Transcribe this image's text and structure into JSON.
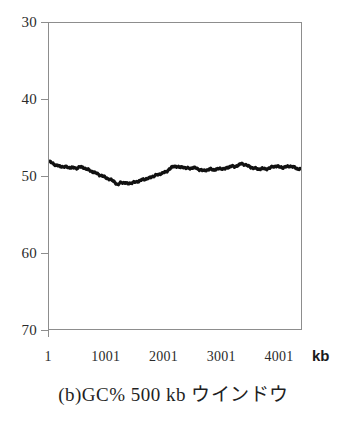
{
  "caption": "(b)GC% 500 kb ウインドウ",
  "axis": {
    "x_unit": "kb",
    "y_ticks": [
      "70",
      "60",
      "50",
      "40",
      "30"
    ],
    "x_ticks": [
      "1",
      "1001",
      "2001",
      "3001",
      "4001"
    ]
  },
  "colors": {
    "frame": "#8d8d8d",
    "series": "#111111",
    "text": "#1f1f1f",
    "background": "#ffffff"
  },
  "chart_data": {
    "type": "line",
    "title": "(b)GC% 500 kb ウインドウ",
    "xlabel": "kb",
    "ylabel": "GC%",
    "xlim": [
      1,
      4400
    ],
    "ylim": [
      30,
      70
    ],
    "xtick_values": [
      1,
      1001,
      2001,
      3001,
      4001
    ],
    "ytick_values": [
      30,
      40,
      50,
      60,
      70
    ],
    "grid": false,
    "legend": null,
    "series": [
      {
        "name": "GC% (500 kb sliding window)",
        "x": [
          1,
          60,
          120,
          180,
          240,
          300,
          360,
          420,
          480,
          540,
          600,
          660,
          720,
          780,
          840,
          900,
          960,
          1020,
          1080,
          1140,
          1200,
          1260,
          1320,
          1380,
          1440,
          1500,
          1560,
          1620,
          1680,
          1740,
          1800,
          1860,
          1920,
          1980,
          2040,
          2100,
          2160,
          2220,
          2280,
          2340,
          2400,
          2460,
          2520,
          2580,
          2640,
          2700,
          2760,
          2820,
          2880,
          2940,
          3000,
          3060,
          3120,
          3180,
          3240,
          3300,
          3360,
          3420,
          3480,
          3540,
          3600,
          3660,
          3720,
          3780,
          3840,
          3900,
          3960,
          4020,
          4080,
          4140,
          4200,
          4260,
          4320,
          4380
        ],
        "y": [
          51.9,
          51.7,
          51.4,
          51.3,
          51.2,
          51.2,
          51.1,
          51.1,
          51.0,
          51.2,
          51.1,
          50.9,
          50.7,
          50.5,
          50.3,
          50.1,
          49.9,
          49.7,
          49.5,
          49.3,
          48.8,
          49.2,
          49.1,
          49.0,
          49.1,
          49.2,
          49.3,
          49.5,
          49.6,
          49.7,
          49.9,
          50.1,
          50.2,
          50.4,
          50.5,
          50.9,
          51.2,
          51.3,
          51.1,
          51.2,
          51.0,
          51.0,
          51.1,
          51.0,
          50.8,
          50.7,
          50.8,
          50.9,
          50.8,
          50.9,
          51.0,
          50.9,
          51.1,
          51.3,
          51.2,
          51.4,
          51.6,
          51.5,
          51.3,
          51.1,
          51.0,
          50.9,
          51.0,
          50.9,
          51.0,
          51.2,
          51.3,
          51.2,
          51.1,
          51.2,
          51.3,
          51.2,
          51.0,
          50.9
        ]
      }
    ]
  }
}
